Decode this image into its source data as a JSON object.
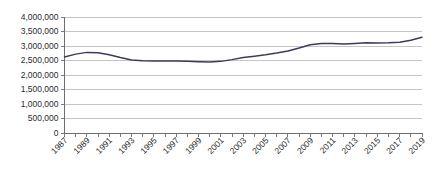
{
  "chart_data": {
    "type": "line",
    "title": "",
    "subtitle": "",
    "xlabel": "",
    "ylabel": "",
    "grid": true,
    "legend_position": "none",
    "xlim": [
      1987,
      2019
    ],
    "ylim": [
      0,
      4000000
    ],
    "ytick_labels": [
      "4,000,000",
      "3,500,000",
      "3,000,000",
      "2,500,000",
      "2,000,000",
      "1,500,000",
      "1,000,000",
      "500,000",
      "0"
    ],
    "ytick_values": [
      4000000,
      3500000,
      3000000,
      2500000,
      2000000,
      1500000,
      1000000,
      500000,
      0
    ],
    "xtick_labels": [
      "1987",
      "1989",
      "1991",
      "1993",
      "1995",
      "1997",
      "1999",
      "2001",
      "2003",
      "2005",
      "2007",
      "2009",
      "2011",
      "2013",
      "2015",
      "2017",
      "2019"
    ],
    "x": [
      1987,
      1988,
      1989,
      1990,
      1991,
      1992,
      1993,
      1994,
      1995,
      1996,
      1997,
      1998,
      1999,
      2000,
      2001,
      2002,
      2003,
      2004,
      2005,
      2006,
      2007,
      2008,
      2009,
      2010,
      2011,
      2012,
      2013,
      2014,
      2015,
      2016,
      2017,
      2018,
      2019
    ],
    "series": [
      {
        "name": "Series 1",
        "color": "#3b3b5c",
        "values": [
          2620000,
          2720000,
          2780000,
          2770000,
          2700000,
          2600000,
          2520000,
          2490000,
          2480000,
          2480000,
          2480000,
          2470000,
          2460000,
          2450000,
          2470000,
          2530000,
          2600000,
          2650000,
          2700000,
          2760000,
          2830000,
          2930000,
          3040000,
          3090000,
          3090000,
          3070000,
          3090000,
          3110000,
          3100000,
          3110000,
          3130000,
          3200000,
          3300000
        ]
      }
    ],
    "colors": {
      "line": "#3b3b5c",
      "gridline": "#b6b6b6",
      "axis": "#6e6e6e",
      "text": "#2b2b2b",
      "background": "#ffffff"
    }
  }
}
